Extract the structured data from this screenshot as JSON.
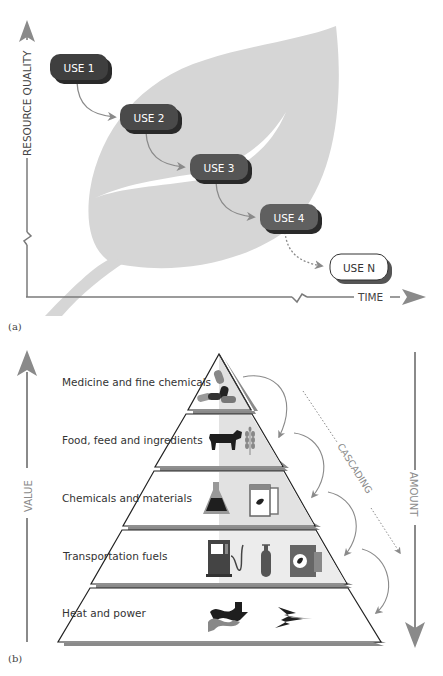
{
  "panel_a": {
    "tag": "(a)",
    "y_axis_label": "RESOURCE QUALITY",
    "x_axis_label": "TIME",
    "uses": [
      {
        "label": "USE 1",
        "fill": "#3f3f3f"
      },
      {
        "label": "USE 2",
        "fill": "#4a4a4a"
      },
      {
        "label": "USE 3",
        "fill": "#555555"
      },
      {
        "label": "USE 4",
        "fill": "#606060"
      },
      {
        "label": "USE N",
        "fill": "#ffffff"
      }
    ],
    "leaf_icon": "leaf-background",
    "colors": {
      "leaf": "#d6d6d6",
      "axis": "#7a7a7a",
      "arrow": "#8a8a8a"
    }
  },
  "panel_b": {
    "tag": "(b)",
    "left_axis_label": "VALUE",
    "right_axis_label": "AMOUNT",
    "cascading_label": "CASCADING",
    "tiers": [
      {
        "label": "Medicine and fine chemicals",
        "icons": [
          "pills-icon"
        ]
      },
      {
        "label": "Food, feed and ingredients",
        "icons": [
          "cow-icon",
          "wheat-icon"
        ]
      },
      {
        "label": "Chemicals and materials",
        "icons": [
          "flask-icon",
          "jars-icon"
        ]
      },
      {
        "label": "Transportation fuels",
        "icons": [
          "fuel-pump-icon",
          "gas-cylinder-icon",
          "barrel-icon"
        ]
      },
      {
        "label": "Heat and power",
        "icons": [
          "heat-waves-icon",
          "lightning-icon"
        ]
      }
    ],
    "colors": {
      "shade": "#e2e2e2",
      "outline": "#222222",
      "shadow": "#8a8a8a",
      "axis": "#8a8a8a"
    }
  }
}
